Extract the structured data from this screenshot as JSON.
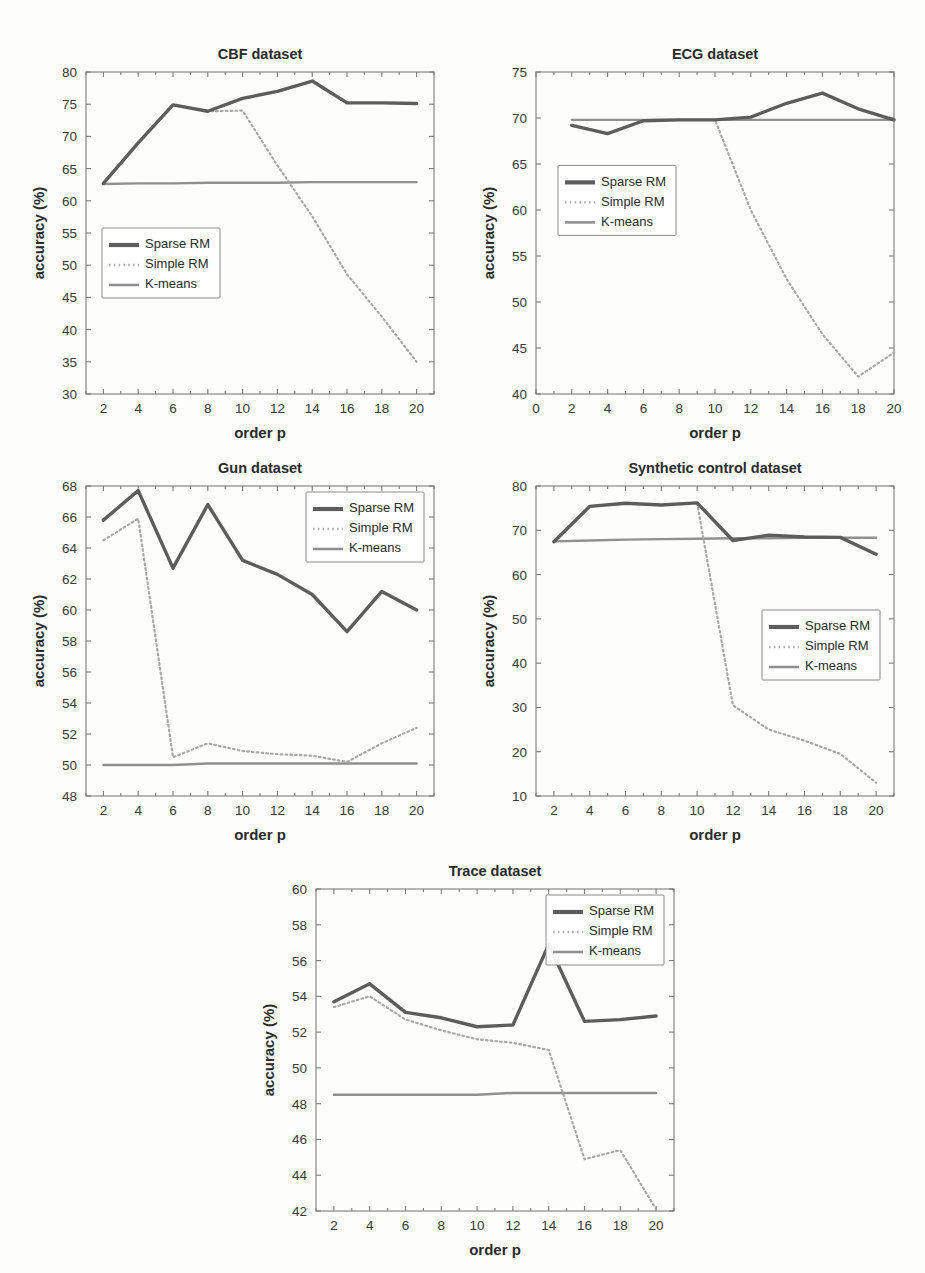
{
  "figure": {
    "axis_label_x": "order p",
    "axis_label_y": "accuracy (%)",
    "legend_entries": [
      "Sparse RM",
      "Simple RM",
      "K-means"
    ],
    "colors": {
      "sparse_rm": "#5d5d5d",
      "simple_rm": "#a8a8a8",
      "kmeans": "#909090",
      "frame": "#7c7c7c",
      "background": "#fdfdfc"
    }
  },
  "chart_data": [
    {
      "type": "line",
      "title": "CBF dataset",
      "xlabel": "order p",
      "ylabel": "accuracy (%)",
      "x": [
        2,
        4,
        6,
        8,
        10,
        12,
        14,
        16,
        18,
        20
      ],
      "xlim": [
        1,
        21
      ],
      "ylim": [
        30,
        80
      ],
      "xticks": [
        2,
        4,
        6,
        8,
        10,
        12,
        14,
        16,
        18,
        20
      ],
      "yticks": [
        30,
        35,
        40,
        45,
        50,
        55,
        60,
        65,
        70,
        75,
        80
      ],
      "grid": false,
      "legend_position": "lower-left",
      "series": [
        {
          "name": "Sparse RM",
          "values": [
            62.7,
            69.0,
            74.9,
            73.9,
            75.9,
            77.0,
            78.6,
            75.2,
            75.2,
            75.1
          ]
        },
        {
          "name": "Simple RM",
          "values": [
            62.7,
            69.0,
            74.9,
            73.9,
            74.0,
            65.5,
            57.6,
            48.6,
            42.0,
            35.0
          ]
        },
        {
          "name": "K-means",
          "values": [
            62.6,
            62.7,
            62.7,
            62.8,
            62.8,
            62.8,
            62.9,
            62.9,
            62.9,
            62.9
          ]
        }
      ]
    },
    {
      "type": "line",
      "title": "ECG dataset",
      "xlabel": "order p",
      "ylabel": "accuracy (%)",
      "x": [
        2,
        4,
        6,
        8,
        10,
        12,
        14,
        16,
        18,
        20
      ],
      "xlim": [
        0,
        20
      ],
      "ylim": [
        40,
        75
      ],
      "xticks": [
        0,
        2,
        4,
        6,
        8,
        10,
        12,
        14,
        16,
        18,
        20
      ],
      "yticks": [
        40,
        45,
        50,
        55,
        60,
        65,
        70,
        75
      ],
      "grid": false,
      "legend_position": "middle-left",
      "series": [
        {
          "name": "Sparse RM",
          "values": [
            69.2,
            68.3,
            69.7,
            69.8,
            69.8,
            70.1,
            71.6,
            72.7,
            71.0,
            69.8
          ]
        },
        {
          "name": "Simple RM",
          "values": [
            69.2,
            68.3,
            69.7,
            69.8,
            69.8,
            60.0,
            52.5,
            46.5,
            41.9,
            44.5
          ]
        },
        {
          "name": "K-means",
          "values": [
            69.8,
            69.8,
            69.8,
            69.8,
            69.8,
            69.8,
            69.8,
            69.8,
            69.8,
            69.8
          ]
        }
      ]
    },
    {
      "type": "line",
      "title": "Gun dataset",
      "xlabel": "order p",
      "ylabel": "accuracy (%)",
      "x": [
        2,
        4,
        6,
        8,
        10,
        12,
        14,
        16,
        18,
        20
      ],
      "xlim": [
        1,
        21
      ],
      "ylim": [
        48,
        68
      ],
      "xticks": [
        2,
        4,
        6,
        8,
        10,
        12,
        14,
        16,
        18,
        20
      ],
      "yticks": [
        48,
        50,
        52,
        54,
        56,
        58,
        60,
        62,
        64,
        66,
        68
      ],
      "grid": false,
      "legend_position": "upper-right",
      "series": [
        {
          "name": "Sparse RM",
          "values": [
            65.8,
            67.7,
            62.7,
            66.8,
            63.2,
            62.3,
            61.0,
            58.6,
            61.2,
            60.0
          ]
        },
        {
          "name": "Simple RM",
          "values": [
            64.5,
            65.9,
            50.5,
            51.4,
            50.9,
            50.7,
            50.6,
            50.2,
            51.4,
            52.4
          ]
        },
        {
          "name": "K-means",
          "values": [
            50.0,
            50.0,
            50.0,
            50.1,
            50.1,
            50.1,
            50.1,
            50.1,
            50.1,
            50.1
          ]
        }
      ]
    },
    {
      "type": "line",
      "title": "Synthetic control dataset",
      "xlabel": "order p",
      "ylabel": "accuracy (%)",
      "x": [
        2,
        4,
        6,
        8,
        10,
        12,
        14,
        16,
        18,
        20
      ],
      "xlim": [
        1,
        21
      ],
      "ylim": [
        10,
        80
      ],
      "xticks": [
        2,
        4,
        6,
        8,
        10,
        12,
        14,
        16,
        18,
        20
      ],
      "yticks": [
        10,
        20,
        30,
        40,
        50,
        60,
        70,
        80
      ],
      "grid": false,
      "legend_position": "middle-right",
      "series": [
        {
          "name": "Sparse RM",
          "values": [
            67.4,
            75.4,
            76.1,
            75.7,
            76.2,
            67.7,
            68.9,
            68.5,
            68.4,
            64.6
          ]
        },
        {
          "name": "Simple RM",
          "values": [
            67.4,
            75.4,
            76.1,
            75.7,
            76.2,
            30.5,
            25.0,
            22.5,
            19.5,
            13.0
          ]
        },
        {
          "name": "K-means",
          "values": [
            67.5,
            67.7,
            67.9,
            68.0,
            68.1,
            68.2,
            68.2,
            68.3,
            68.3,
            68.3
          ]
        }
      ]
    },
    {
      "type": "line",
      "title": "Trace dataset",
      "xlabel": "order p",
      "ylabel": "accuracy (%)",
      "x": [
        2,
        4,
        6,
        8,
        10,
        12,
        14,
        16,
        18,
        20
      ],
      "xlim": [
        1,
        21
      ],
      "ylim": [
        42,
        60
      ],
      "xticks": [
        2,
        4,
        6,
        8,
        10,
        12,
        14,
        16,
        18,
        20
      ],
      "yticks": [
        42,
        44,
        46,
        48,
        50,
        52,
        54,
        56,
        58,
        60
      ],
      "grid": false,
      "legend_position": "upper-right",
      "series": [
        {
          "name": "Sparse RM",
          "values": [
            53.7,
            54.7,
            53.1,
            52.8,
            52.3,
            52.4,
            56.9,
            52.6,
            52.7,
            52.9
          ]
        },
        {
          "name": "Simple RM",
          "values": [
            53.4,
            54.0,
            52.7,
            52.1,
            51.6,
            51.4,
            51.0,
            44.9,
            45.4,
            42.1
          ]
        },
        {
          "name": "K-means",
          "values": [
            48.5,
            48.5,
            48.5,
            48.5,
            48.5,
            48.6,
            48.6,
            48.6,
            48.6,
            48.6
          ]
        }
      ]
    }
  ],
  "panels": [
    {
      "id": "cbf",
      "left": 20,
      "top": 38,
      "width": 430,
      "height": 412
    },
    {
      "id": "ecg",
      "left": 470,
      "top": 38,
      "width": 440,
      "height": 412
    },
    {
      "id": "gun",
      "left": 20,
      "top": 452,
      "width": 430,
      "height": 400
    },
    {
      "id": "synthetic",
      "left": 470,
      "top": 452,
      "width": 440,
      "height": 400
    },
    {
      "id": "trace",
      "left": 250,
      "top": 855,
      "width": 440,
      "height": 412
    }
  ]
}
